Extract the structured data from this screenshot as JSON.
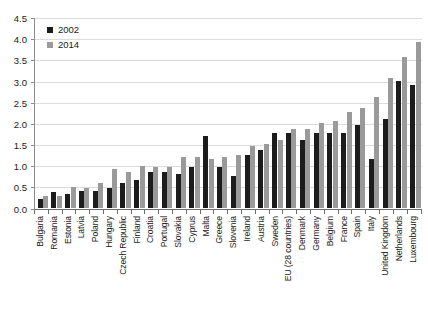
{
  "chart_data": {
    "type": "bar",
    "title": "",
    "subtitle": "",
    "xlabel": "",
    "ylabel": "",
    "ylim": [
      0.0,
      4.5
    ],
    "ytick_labels": [
      "0.0",
      "0.5",
      "1.0",
      "1.5",
      "2.0",
      "2.5",
      "3.0",
      "3.5",
      "4.0",
      "4.5"
    ],
    "ytick_values": [
      0.0,
      0.5,
      1.0,
      1.5,
      2.0,
      2.5,
      3.0,
      3.5,
      4.0,
      4.5
    ],
    "grid": true,
    "legend_position": "top-left",
    "categories": [
      "Bulgaria",
      "Romania",
      "Estonia",
      "Latvia",
      "Poland",
      "Hungary",
      "Czech Republic",
      "Finland",
      "Croatia",
      "Portugal",
      "Slovakia",
      "Cyprus",
      "Malta",
      "Greece",
      "Slovenia",
      "Ireland",
      "Austria",
      "Sweden",
      "EU (28 countries)",
      "Denmark",
      "Germany",
      "Belgium",
      "France",
      "Spain",
      "Italy",
      "United Kingdom",
      "Netherlands",
      "Luxembourg"
    ],
    "series": [
      {
        "name": "2002",
        "color": "#1c1c1c",
        "values": [
          0.2,
          0.37,
          0.33,
          0.38,
          0.38,
          0.47,
          0.57,
          0.65,
          0.85,
          0.85,
          0.8,
          0.95,
          1.7,
          0.95,
          0.75,
          1.25,
          1.35,
          1.75,
          1.75,
          1.6,
          1.75,
          1.75,
          1.75,
          1.95,
          1.15,
          2.1,
          3.0,
          2.9
        ]
      },
      {
        "name": "2014",
        "color": "#9a9a9a",
        "values": [
          0.28,
          0.28,
          0.48,
          0.45,
          0.57,
          0.9,
          0.85,
          0.97,
          0.95,
          0.95,
          1.2,
          1.2,
          1.15,
          1.2,
          1.25,
          1.45,
          1.5,
          1.6,
          1.85,
          1.85,
          2.0,
          2.05,
          2.25,
          2.35,
          2.6,
          3.05,
          3.55,
          3.9
        ]
      }
    ]
  },
  "legend": {
    "items": [
      {
        "label": "2002",
        "color": "#1c1c1c"
      },
      {
        "label": "2014",
        "color": "#9a9a9a"
      }
    ]
  },
  "colors": {
    "series_2002": "#1c1c1c",
    "series_2014": "#9a9a9a",
    "gridline": "#dcdcdc",
    "axis": "#6e6e6e",
    "background": "#ffffff",
    "text": "#1a1a1a"
  }
}
